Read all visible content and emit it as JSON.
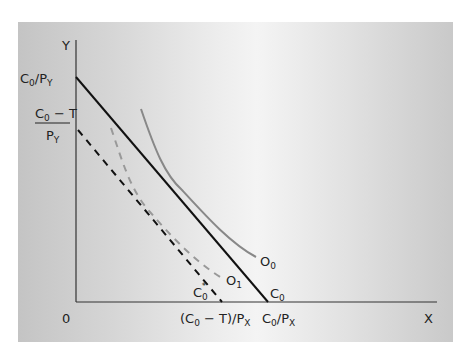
{
  "diagram": {
    "axes": {
      "y_label": "Y",
      "x_label": "X",
      "origin_label": "0"
    },
    "y_intercepts": {
      "budget": {
        "numer": "C",
        "numer_sub": "0",
        "slash": "/P",
        "den_sub": "Y"
      },
      "taxed": {
        "numer": "C",
        "numer_sub": "0",
        "minus_t": " − T",
        "denom": "P",
        "denom_sub": "Y"
      }
    },
    "x_intercepts": {
      "taxed": {
        "open": "(C",
        "sub0": "0",
        "mid": " − T)/P",
        "subx": "X"
      },
      "budget": {
        "c": "C",
        "sub0": "0",
        "mid": "/P",
        "subx": "X"
      }
    },
    "curves": [
      {
        "id": "C0",
        "label": "C",
        "sub": "0",
        "style": "solid-black",
        "desc": "budget line"
      },
      {
        "id": "C0star",
        "label": "C",
        "sub": "0",
        "sup": "*",
        "style": "dashed-black",
        "desc": "budget line after tax"
      },
      {
        "id": "O0",
        "label": "O",
        "sub": "0",
        "style": "solid-gray",
        "desc": "indifference curve"
      },
      {
        "id": "O1",
        "label": "O",
        "sub": "1",
        "style": "dashed-gray",
        "desc": "lower indifference curve"
      }
    ],
    "colors": {
      "axis": "#333333",
      "budget": "#111111",
      "indifference": "#888888"
    }
  }
}
